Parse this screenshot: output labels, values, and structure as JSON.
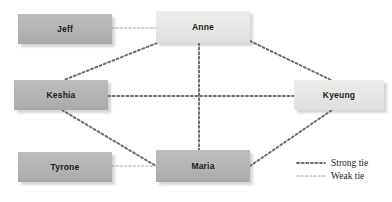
{
  "diagram": {
    "canvas": {
      "width": 392,
      "height": 202
    },
    "colors": {
      "background": "#ffffff",
      "node_dark": "#b4b4b4",
      "node_light": "#e6e6e5",
      "strong_tie": "#6e6e6e",
      "weak_tie": "#c2c2c2",
      "label_text": "#1b1b1b"
    },
    "nodes": [
      {
        "id": "jeff",
        "label": "Jeff",
        "tone": "dark",
        "x": 18,
        "y": 14,
        "w": 94,
        "h": 30
      },
      {
        "id": "anne",
        "label": "Anne",
        "tone": "light",
        "x": 156,
        "y": 11,
        "w": 94,
        "h": 32
      },
      {
        "id": "keshia",
        "label": "Keshia",
        "tone": "dark",
        "x": 14,
        "y": 80,
        "w": 94,
        "h": 30
      },
      {
        "id": "kyeung",
        "label": "Kyeung",
        "tone": "light",
        "x": 294,
        "y": 80,
        "w": 90,
        "h": 30
      },
      {
        "id": "tyrone",
        "label": "Tyrone",
        "tone": "dark",
        "x": 18,
        "y": 152,
        "w": 94,
        "h": 30
      },
      {
        "id": "maria",
        "label": "Maria",
        "tone": "dark",
        "x": 156,
        "y": 150,
        "w": 94,
        "h": 32
      }
    ],
    "edges": [
      {
        "id": "jeff-anne",
        "source": "jeff",
        "target": "anne",
        "tie": "weak",
        "x1": 112,
        "y1": 28,
        "x2": 156,
        "y2": 28
      },
      {
        "id": "anne-keshia",
        "source": "anne",
        "target": "keshia",
        "tie": "strong",
        "x1": 157,
        "y1": 43,
        "x2": 64,
        "y2": 80
      },
      {
        "id": "anne-kyeung",
        "source": "anne",
        "target": "kyeung",
        "tie": "strong",
        "x1": 250,
        "y1": 41,
        "x2": 331,
        "y2": 80
      },
      {
        "id": "anne-maria",
        "source": "anne",
        "target": "maria",
        "tie": "strong",
        "x1": 199,
        "y1": 43,
        "x2": 199,
        "y2": 150
      },
      {
        "id": "keshia-kyeung",
        "source": "keshia",
        "target": "kyeung",
        "tie": "strong",
        "x1": 108,
        "y1": 96,
        "x2": 294,
        "y2": 96
      },
      {
        "id": "keshia-maria",
        "source": "keshia",
        "target": "maria",
        "tie": "strong",
        "x1": 62,
        "y1": 110,
        "x2": 156,
        "y2": 166
      },
      {
        "id": "tyrone-maria",
        "source": "tyrone",
        "target": "maria",
        "tie": "weak",
        "x1": 112,
        "y1": 166,
        "x2": 156,
        "y2": 166
      },
      {
        "id": "maria-kyeung",
        "source": "maria",
        "target": "kyeung",
        "tie": "strong",
        "x1": 250,
        "y1": 166,
        "x2": 332,
        "y2": 110
      }
    ],
    "legend": {
      "x": 296,
      "y": 156,
      "items": [
        {
          "id": "strong",
          "label": "Strong tie",
          "tie": "strong"
        },
        {
          "id": "weak",
          "label": "Weak tie",
          "tie": "weak"
        }
      ]
    }
  }
}
